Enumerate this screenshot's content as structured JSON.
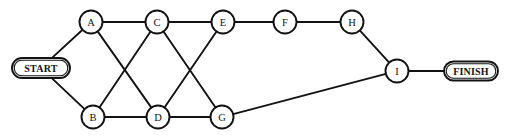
{
  "diagram": {
    "type": "undirected-graph",
    "title": "",
    "width": 507,
    "height": 140,
    "background_color": "#ffffff",
    "stroke_color": "#121212",
    "node_fill_color": "#ffffff",
    "nodes": [
      {
        "id": "START",
        "label": "START",
        "shape": "stadium",
        "x": 41,
        "y": 68,
        "rx": 29,
        "ry": 10
      },
      {
        "id": "A",
        "label": "A",
        "shape": "circle",
        "x": 91,
        "y": 22,
        "r": 11.5
      },
      {
        "id": "B",
        "label": "B",
        "shape": "circle",
        "x": 93,
        "y": 117,
        "r": 11.5
      },
      {
        "id": "C",
        "label": "C",
        "shape": "circle",
        "x": 157,
        "y": 22,
        "r": 11.5
      },
      {
        "id": "D",
        "label": "D",
        "shape": "circle",
        "x": 158,
        "y": 117,
        "r": 11.5
      },
      {
        "id": "E",
        "label": "E",
        "shape": "circle",
        "x": 223,
        "y": 22,
        "r": 11.5
      },
      {
        "id": "F",
        "label": "F",
        "shape": "circle",
        "x": 285,
        "y": 22,
        "r": 11.5
      },
      {
        "id": "G",
        "label": "G",
        "shape": "circle",
        "x": 222,
        "y": 117,
        "r": 11.5
      },
      {
        "id": "H",
        "label": "H",
        "shape": "circle",
        "x": 352,
        "y": 22,
        "r": 11.5
      },
      {
        "id": "I",
        "label": "I",
        "shape": "circle",
        "x": 397,
        "y": 71,
        "r": 11.5
      },
      {
        "id": "FINISH",
        "label": "FINISH",
        "shape": "stadium",
        "x": 471,
        "y": 71,
        "rx": 27,
        "ry": 9.5
      }
    ],
    "edges": [
      {
        "from": "START",
        "to": "A"
      },
      {
        "from": "START",
        "to": "B"
      },
      {
        "from": "A",
        "to": "C"
      },
      {
        "from": "A",
        "to": "D"
      },
      {
        "from": "B",
        "to": "C"
      },
      {
        "from": "B",
        "to": "D"
      },
      {
        "from": "C",
        "to": "E"
      },
      {
        "from": "C",
        "to": "G"
      },
      {
        "from": "D",
        "to": "E"
      },
      {
        "from": "D",
        "to": "G"
      },
      {
        "from": "E",
        "to": "F"
      },
      {
        "from": "F",
        "to": "H"
      },
      {
        "from": "G",
        "to": "I"
      },
      {
        "from": "H",
        "to": "I"
      },
      {
        "from": "I",
        "to": "FINISH"
      }
    ]
  }
}
